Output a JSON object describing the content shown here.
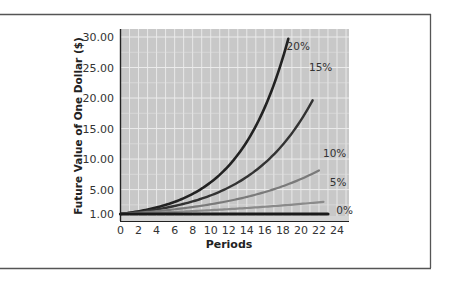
{
  "chart_data": {
    "type": "line",
    "title": "",
    "xlabel": "Periods",
    "ylabel": "Future Value of One Dollar ($)",
    "xlim": [
      0,
      24
    ],
    "ylim": [
      0,
      33
    ],
    "xticks": [
      0,
      2,
      4,
      6,
      8,
      10,
      12,
      14,
      16,
      18,
      20,
      22,
      24
    ],
    "xtick_labels": [
      "0",
      "2",
      "4",
      "6",
      "8",
      "10",
      "12",
      "14",
      "16",
      "18",
      "20",
      "22",
      "24"
    ],
    "yticks": [
      1,
      5,
      10,
      15,
      20,
      25,
      30
    ],
    "ytick_labels": [
      "1.00",
      "5.00",
      "10.00",
      "15.00",
      "20.00",
      "25.00",
      "30.00"
    ],
    "grid": true,
    "legend_position": "inline labels at curve ends",
    "series": [
      {
        "name": "20%",
        "rate": 0.2,
        "end_period": 18.6,
        "color": "#222222",
        "label": "20%"
      },
      {
        "name": "15%",
        "rate": 0.15,
        "end_period": 21.3,
        "color": "#333333",
        "label": "15%"
      },
      {
        "name": "10%",
        "rate": 0.1,
        "end_period": 22.0,
        "color": "#7a7a7a",
        "label": "10%"
      },
      {
        "name": "5%",
        "rate": 0.05,
        "end_period": 22.5,
        "color": "#8a8a8a",
        "label": "5%"
      },
      {
        "name": "0%",
        "rate": 0.0,
        "end_period": 23.0,
        "color": "#1a1a1a",
        "label": "0%"
      }
    ],
    "sample_points": {
      "20%": [
        [
          0,
          1.0
        ],
        [
          4,
          2.07
        ],
        [
          8,
          4.3
        ],
        [
          12,
          8.92
        ],
        [
          16,
          18.49
        ],
        [
          18.6,
          29.7
        ]
      ],
      "15%": [
        [
          0,
          1.0
        ],
        [
          4,
          1.75
        ],
        [
          8,
          3.06
        ],
        [
          12,
          5.35
        ],
        [
          16,
          9.36
        ],
        [
          20,
          16.37
        ],
        [
          21.3,
          19.6
        ]
      ],
      "10%": [
        [
          0,
          1.0
        ],
        [
          4,
          1.46
        ],
        [
          8,
          2.14
        ],
        [
          12,
          3.14
        ],
        [
          16,
          4.59
        ],
        [
          20,
          6.73
        ],
        [
          22,
          8.14
        ]
      ],
      "5%": [
        [
          0,
          1.0
        ],
        [
          4,
          1.22
        ],
        [
          8,
          1.48
        ],
        [
          12,
          1.8
        ],
        [
          16,
          2.18
        ],
        [
          20,
          2.65
        ],
        [
          22.5,
          3.0
        ]
      ],
      "0%": [
        [
          0,
          1.0
        ],
        [
          23,
          1.0
        ]
      ]
    }
  },
  "colors": {
    "plot_background": "#c8c8c8",
    "grid": "#ececec",
    "axis": "#222222",
    "text": "#222222",
    "frame": "#555555"
  }
}
